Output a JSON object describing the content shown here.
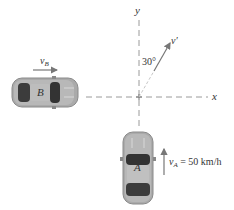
{
  "diagram": {
    "type": "relative-velocity",
    "axes": {
      "x_label": "x",
      "y_label": "y",
      "origin": [
        139,
        97
      ]
    },
    "angle_label": "30°",
    "relative_velocity_label": "v′",
    "car_a": {
      "label": "A",
      "heading": "north",
      "velocity_label": "v",
      "velocity_subscript": "A",
      "velocity_value": "= 50 km/h"
    },
    "car_b": {
      "label": "B",
      "heading": "east",
      "velocity_label": "v",
      "velocity_subscript": "B"
    },
    "colors": {
      "axis": "#8a8a8a",
      "car_body": "#a8a8a8",
      "car_glass": "#3a3a3a",
      "arrow": "#777777",
      "text": "#333333"
    }
  }
}
